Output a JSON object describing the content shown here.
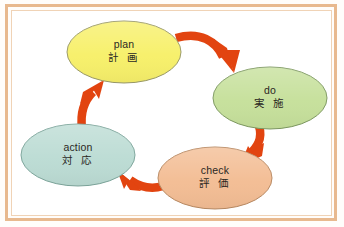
{
  "diagram": {
    "background_color": "#ffffff",
    "frame_color": "#e8b98f",
    "arrow_color": "#e24410",
    "nodes": [
      {
        "id": "plan",
        "label_en": "plan",
        "label_jp": "計 画",
        "fill": "#f7f06a",
        "stroke": "#9a9a6a",
        "cx": 124,
        "cy": 52,
        "rx": 57,
        "ry": 31
      },
      {
        "id": "do",
        "label_en": "do",
        "label_jp": "実 施",
        "fill": "#c6e09b",
        "stroke": "#7f9a63",
        "cx": 270,
        "cy": 98,
        "rx": 57,
        "ry": 31
      },
      {
        "id": "check",
        "label_en": "check",
        "label_jp": "評 価",
        "fill": "#f3bd94",
        "stroke": "#b98a63",
        "cx": 215,
        "cy": 178,
        "rx": 57,
        "ry": 31
      },
      {
        "id": "action",
        "label_en": "action",
        "label_jp": "対 応",
        "fill": "#bcdcd4",
        "stroke": "#7ea69c",
        "cx": 78,
        "cy": 155,
        "rx": 57,
        "ry": 31
      }
    ],
    "arrows": [
      {
        "id": "plan-to-do",
        "from": "plan",
        "to": "do"
      },
      {
        "id": "do-to-check",
        "from": "do",
        "to": "check"
      },
      {
        "id": "check-to-action",
        "from": "check",
        "to": "action"
      },
      {
        "id": "action-to-plan",
        "from": "action",
        "to": "plan"
      }
    ]
  }
}
